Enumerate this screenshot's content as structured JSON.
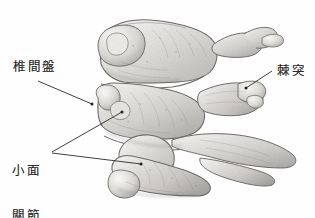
{
  "figure": {
    "kind": "anatomical-illustration",
    "background_color": "#fefefe",
    "ink_color": "#2b2b2b",
    "bone_light": "#f2f1ef",
    "bone_mid": "#cfcdca",
    "bone_dark": "#8e8c89",
    "shadow": "#6b6a68"
  },
  "labels": {
    "intervertebral_disc": "椎間盤",
    "facet_joint_line1": "小面",
    "facet_joint_line2": "關節",
    "spinous_process": "棘突"
  },
  "leaders": {
    "disc": {
      "from_x": 38,
      "from_y": 81,
      "to_x": 92,
      "to_y": 104
    },
    "facet_upper": {
      "from_x": 52,
      "from_y": 152,
      "to_x": 122,
      "to_y": 112
    },
    "facet_lower": {
      "from_x": 52,
      "from_y": 153,
      "to_x": 141,
      "to_y": 164
    },
    "spinous": {
      "from_x": 272,
      "from_y": 71,
      "to_x": 246,
      "to_y": 88
    }
  }
}
